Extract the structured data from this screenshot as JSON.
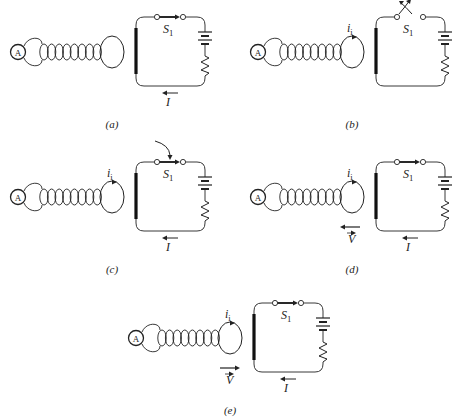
{
  "figure": {
    "labels": {
      "ammeter": "A",
      "switch": "S",
      "switch_sub": "1",
      "current": "I",
      "induced_current": "i",
      "induced_sub": "i",
      "velocity": "V"
    },
    "colors": {
      "ink": "#222222",
      "wire": "#444444"
    }
  },
  "panels": [
    {
      "id": "a",
      "caption": "(a)",
      "x": 0,
      "y": 0,
      "switch_state": "closed",
      "switch_action": "none",
      "show_I": true,
      "show_induced": false,
      "velocity": "none"
    },
    {
      "id": "b",
      "caption": "(b)",
      "x": 240,
      "y": 0,
      "switch_state": "open",
      "switch_action": "opening",
      "show_I": false,
      "show_induced": true,
      "velocity": "none"
    },
    {
      "id": "c",
      "caption": "(c)",
      "x": 0,
      "y": 145,
      "switch_state": "closed",
      "switch_action": "closing",
      "show_I": true,
      "show_induced": true,
      "velocity": "none"
    },
    {
      "id": "d",
      "caption": "(d)",
      "x": 240,
      "y": 145,
      "switch_state": "closed",
      "switch_action": "none",
      "show_I": true,
      "show_induced": true,
      "velocity": "left"
    },
    {
      "id": "e",
      "caption": "(e)",
      "x": 118,
      "y": 286,
      "switch_state": "closed",
      "switch_action": "none",
      "show_I": true,
      "show_induced": true,
      "velocity": "right"
    }
  ]
}
